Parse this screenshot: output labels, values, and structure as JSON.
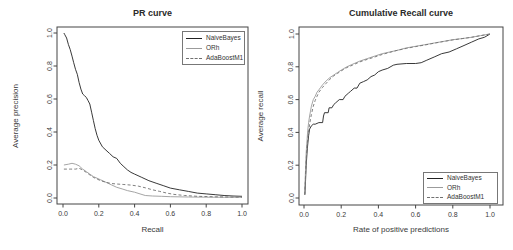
{
  "figure": {
    "background": "#ffffff",
    "axis_color": "#444444",
    "tick_text_color": "#3a3a3a"
  },
  "chart_data": [
    {
      "id": "pr-curve",
      "type": "line",
      "title": "PR curve",
      "xlabel": "Recall",
      "ylabel": "Average precision",
      "xlim": [
        0,
        1
      ],
      "ylim": [
        0,
        1
      ],
      "grid": false,
      "xtick_labels": [
        "0.0",
        "0.2",
        "0.4",
        "0.6",
        "0.8",
        "1.0"
      ],
      "ytick_labels": [
        "0.0",
        "0.2",
        "0.4",
        "0.6",
        "0.8",
        "1.0"
      ],
      "legend_position": "top-right",
      "series": [
        {
          "name": "NaiveBayes",
          "style": "solid",
          "color": "#222222",
          "points": [
            [
              0.005,
              1.0
            ],
            [
              0.01,
              0.99
            ],
            [
              0.02,
              0.97
            ],
            [
              0.03,
              0.93
            ],
            [
              0.04,
              0.9
            ],
            [
              0.05,
              0.86
            ],
            [
              0.06,
              0.82
            ],
            [
              0.07,
              0.78
            ],
            [
              0.08,
              0.75
            ],
            [
              0.09,
              0.7
            ],
            [
              0.1,
              0.66
            ],
            [
              0.11,
              0.63
            ],
            [
              0.12,
              0.62
            ],
            [
              0.13,
              0.61
            ],
            [
              0.14,
              0.59
            ],
            [
              0.15,
              0.57
            ],
            [
              0.16,
              0.52
            ],
            [
              0.17,
              0.47
            ],
            [
              0.18,
              0.42
            ],
            [
              0.19,
              0.38
            ],
            [
              0.2,
              0.35
            ],
            [
              0.22,
              0.31
            ],
            [
              0.24,
              0.29
            ],
            [
              0.26,
              0.27
            ],
            [
              0.28,
              0.25
            ],
            [
              0.3,
              0.24
            ],
            [
              0.32,
              0.21
            ],
            [
              0.34,
              0.19
            ],
            [
              0.36,
              0.17
            ],
            [
              0.38,
              0.155
            ],
            [
              0.4,
              0.145
            ],
            [
              0.44,
              0.125
            ],
            [
              0.48,
              0.105
            ],
            [
              0.52,
              0.09
            ],
            [
              0.56,
              0.075
            ],
            [
              0.6,
              0.06
            ],
            [
              0.65,
              0.05
            ],
            [
              0.7,
              0.04
            ],
            [
              0.75,
              0.03
            ],
            [
              0.8,
              0.025
            ],
            [
              0.85,
              0.02
            ],
            [
              0.9,
              0.015
            ],
            [
              0.95,
              0.012
            ],
            [
              1.0,
              0.01
            ]
          ]
        },
        {
          "name": "ORh",
          "style": "solid",
          "color": "#9b9b9b",
          "points": [
            [
              0.005,
              0.2
            ],
            [
              0.03,
              0.205
            ],
            [
              0.05,
              0.21
            ],
            [
              0.07,
              0.205
            ],
            [
              0.09,
              0.195
            ],
            [
              0.1,
              0.185
            ],
            [
              0.11,
              0.175
            ],
            [
              0.13,
              0.16
            ],
            [
              0.15,
              0.145
            ],
            [
              0.17,
              0.13
            ],
            [
              0.19,
              0.12
            ],
            [
              0.21,
              0.11
            ],
            [
              0.24,
              0.095
            ],
            [
              0.27,
              0.08
            ],
            [
              0.3,
              0.065
            ],
            [
              0.33,
              0.055
            ],
            [
              0.36,
              0.045
            ],
            [
              0.4,
              0.035
            ],
            [
              0.43,
              0.025
            ],
            [
              0.46,
              0.015
            ],
            [
              0.5,
              0.012
            ],
            [
              0.55,
              0.01
            ],
            [
              0.6,
              0.008
            ],
            [
              0.7,
              0.006
            ],
            [
              0.8,
              0.005
            ],
            [
              0.9,
              0.004
            ],
            [
              1.0,
              0.004
            ]
          ]
        },
        {
          "name": "AdaBoostM1",
          "style": "dashed",
          "color": "#707070",
          "points": [
            [
              0.005,
              0.175
            ],
            [
              0.04,
              0.175
            ],
            [
              0.07,
              0.175
            ],
            [
              0.09,
              0.18
            ],
            [
              0.11,
              0.17
            ],
            [
              0.13,
              0.155
            ],
            [
              0.15,
              0.14
            ],
            [
              0.17,
              0.125
            ],
            [
              0.19,
              0.115
            ],
            [
              0.21,
              0.105
            ],
            [
              0.24,
              0.095
            ],
            [
              0.27,
              0.088
            ],
            [
              0.3,
              0.085
            ],
            [
              0.34,
              0.082
            ],
            [
              0.38,
              0.078
            ],
            [
              0.42,
              0.072
            ],
            [
              0.46,
              0.062
            ],
            [
              0.5,
              0.05
            ],
            [
              0.54,
              0.04
            ],
            [
              0.58,
              0.03
            ],
            [
              0.62,
              0.022
            ],
            [
              0.68,
              0.015
            ],
            [
              0.75,
              0.01
            ],
            [
              0.85,
              0.007
            ],
            [
              1.0,
              0.005
            ]
          ]
        }
      ]
    },
    {
      "id": "cumulative-recall-curve",
      "type": "line",
      "title": "Cumulative Recall curve",
      "xlabel": "Rate of positive predictions",
      "ylabel": "Average recall",
      "xlim": [
        0,
        1
      ],
      "ylim": [
        0,
        1
      ],
      "grid": false,
      "xtick_labels": [
        "0.0",
        "0.2",
        "0.4",
        "0.6",
        "0.8",
        "1.0"
      ],
      "ytick_labels": [
        "0.0",
        "0.2",
        "0.4",
        "0.6",
        "0.8",
        "1.0"
      ],
      "legend_position": "bottom-right",
      "series": [
        {
          "name": "NaiveBayes",
          "style": "solid",
          "color": "#222222",
          "points": [
            [
              0.005,
              0.02
            ],
            [
              0.008,
              0.1
            ],
            [
              0.012,
              0.2
            ],
            [
              0.018,
              0.3
            ],
            [
              0.025,
              0.38
            ],
            [
              0.03,
              0.42
            ],
            [
              0.04,
              0.44
            ],
            [
              0.05,
              0.45
            ],
            [
              0.06,
              0.45
            ],
            [
              0.08,
              0.46
            ],
            [
              0.1,
              0.46
            ],
            [
              0.105,
              0.5
            ],
            [
              0.11,
              0.52
            ],
            [
              0.13,
              0.52
            ],
            [
              0.135,
              0.55
            ],
            [
              0.15,
              0.55
            ],
            [
              0.16,
              0.57
            ],
            [
              0.17,
              0.58
            ],
            [
              0.19,
              0.6
            ],
            [
              0.21,
              0.6
            ],
            [
              0.22,
              0.62
            ],
            [
              0.24,
              0.64
            ],
            [
              0.25,
              0.65
            ],
            [
              0.27,
              0.67
            ],
            [
              0.285,
              0.67
            ],
            [
              0.3,
              0.7
            ],
            [
              0.32,
              0.71
            ],
            [
              0.34,
              0.72
            ],
            [
              0.36,
              0.74
            ],
            [
              0.38,
              0.75
            ],
            [
              0.4,
              0.77
            ],
            [
              0.42,
              0.78
            ],
            [
              0.45,
              0.79
            ],
            [
              0.48,
              0.81
            ],
            [
              0.5,
              0.815
            ],
            [
              0.55,
              0.82
            ],
            [
              0.6,
              0.82
            ],
            [
              0.63,
              0.825
            ],
            [
              0.66,
              0.84
            ],
            [
              0.7,
              0.86
            ],
            [
              0.74,
              0.88
            ],
            [
              0.78,
              0.89
            ],
            [
              0.82,
              0.91
            ],
            [
              0.86,
              0.93
            ],
            [
              0.9,
              0.95
            ],
            [
              0.94,
              0.97
            ],
            [
              0.97,
              0.98
            ],
            [
              1.0,
              1.0
            ]
          ]
        },
        {
          "name": "ORh",
          "style": "solid",
          "color": "#9b9b9b",
          "points": [
            [
              0.004,
              0.02
            ],
            [
              0.006,
              0.1
            ],
            [
              0.009,
              0.2
            ],
            [
              0.012,
              0.28
            ],
            [
              0.016,
              0.35
            ],
            [
              0.02,
              0.41
            ],
            [
              0.025,
              0.46
            ],
            [
              0.03,
              0.5
            ],
            [
              0.035,
              0.53
            ],
            [
              0.04,
              0.56
            ],
            [
              0.05,
              0.6
            ],
            [
              0.06,
              0.62
            ],
            [
              0.07,
              0.645
            ],
            [
              0.08,
              0.66
            ],
            [
              0.09,
              0.675
            ],
            [
              0.1,
              0.69
            ],
            [
              0.12,
              0.715
            ],
            [
              0.14,
              0.735
            ],
            [
              0.16,
              0.75
            ],
            [
              0.18,
              0.765
            ],
            [
              0.2,
              0.78
            ],
            [
              0.23,
              0.8
            ],
            [
              0.26,
              0.815
            ],
            [
              0.3,
              0.835
            ],
            [
              0.34,
              0.85
            ],
            [
              0.38,
              0.865
            ],
            [
              0.42,
              0.88
            ],
            [
              0.46,
              0.89
            ],
            [
              0.5,
              0.9
            ],
            [
              0.55,
              0.915
            ],
            [
              0.6,
              0.925
            ],
            [
              0.65,
              0.935
            ],
            [
              0.7,
              0.945
            ],
            [
              0.75,
              0.955
            ],
            [
              0.8,
              0.965
            ],
            [
              0.85,
              0.972
            ],
            [
              0.9,
              0.98
            ],
            [
              0.95,
              0.99
            ],
            [
              1.0,
              1.0
            ]
          ]
        },
        {
          "name": "AdaBoostM1",
          "style": "dashed",
          "color": "#707070",
          "points": [
            [
              0.004,
              0.02
            ],
            [
              0.007,
              0.1
            ],
            [
              0.01,
              0.2
            ],
            [
              0.014,
              0.27
            ],
            [
              0.018,
              0.33
            ],
            [
              0.023,
              0.39
            ],
            [
              0.03,
              0.45
            ],
            [
              0.04,
              0.51
            ],
            [
              0.05,
              0.56
            ],
            [
              0.06,
              0.595
            ],
            [
              0.07,
              0.62
            ],
            [
              0.08,
              0.645
            ],
            [
              0.09,
              0.66
            ],
            [
              0.1,
              0.675
            ],
            [
              0.12,
              0.7
            ],
            [
              0.14,
              0.725
            ],
            [
              0.16,
              0.745
            ],
            [
              0.18,
              0.76
            ],
            [
              0.2,
              0.775
            ],
            [
              0.23,
              0.795
            ],
            [
              0.26,
              0.81
            ],
            [
              0.3,
              0.83
            ],
            [
              0.34,
              0.845
            ],
            [
              0.38,
              0.86
            ],
            [
              0.42,
              0.875
            ],
            [
              0.46,
              0.888
            ],
            [
              0.5,
              0.9
            ],
            [
              0.55,
              0.912
            ],
            [
              0.6,
              0.923
            ],
            [
              0.65,
              0.933
            ],
            [
              0.7,
              0.944
            ],
            [
              0.75,
              0.954
            ],
            [
              0.8,
              0.964
            ],
            [
              0.85,
              0.972
            ],
            [
              0.9,
              0.98
            ],
            [
              0.95,
              0.99
            ],
            [
              1.0,
              1.0
            ]
          ]
        }
      ]
    }
  ]
}
